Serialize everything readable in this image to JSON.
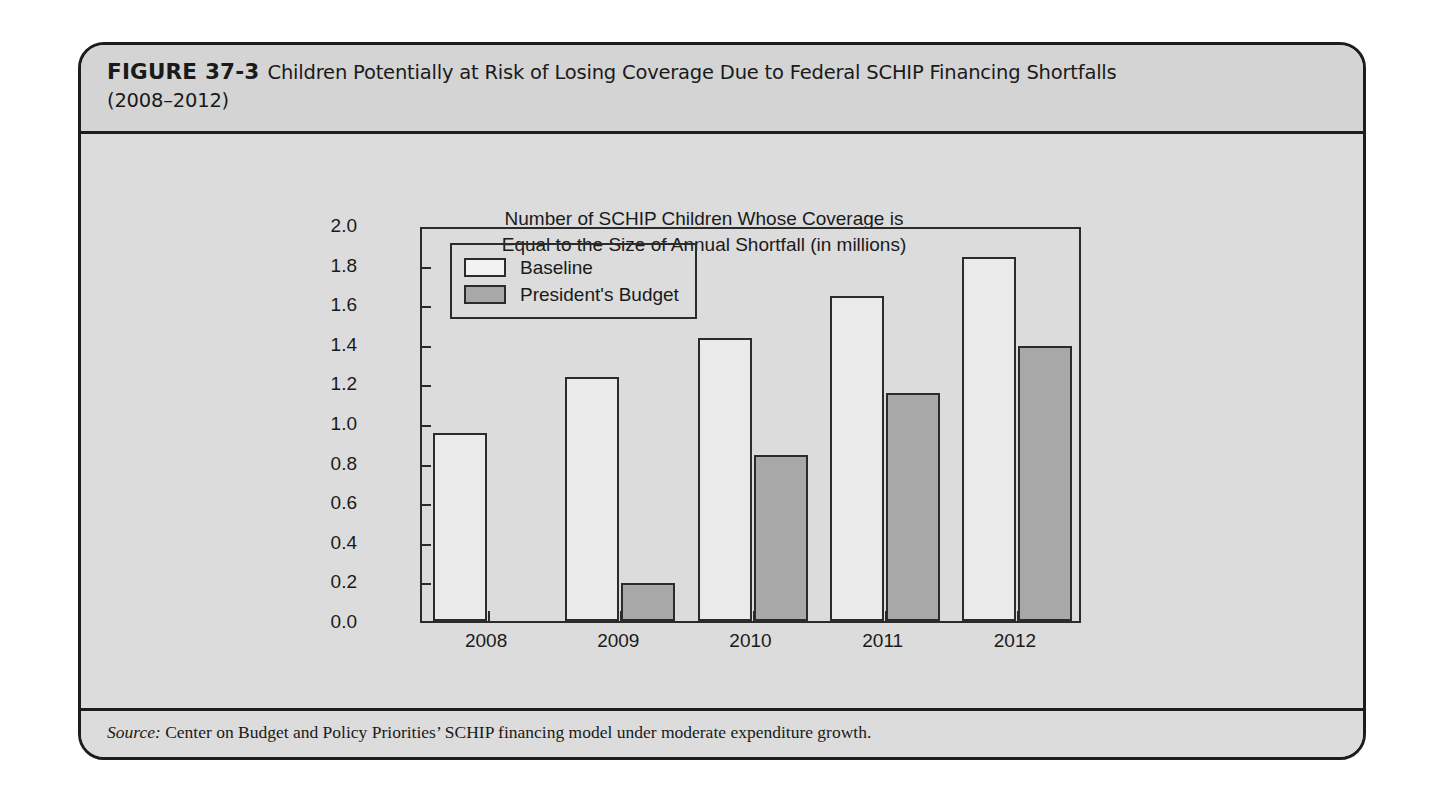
{
  "figure": {
    "number_label": "FIGURE 37-3",
    "title_line1": "Children Potentially at Risk of Losing Coverage Due to Federal SCHIP Financing Shortfalls",
    "title_line2": "(2008–2012)",
    "source_lead": "Source:",
    "source_text": " Center on Budget and Policy Priorities’ SCHIP financing model under moderate expenditure growth."
  },
  "colors": {
    "baseline_fill": "#eaeaea",
    "president_fill": "#a8a8a8",
    "frame": "#2b2b2b",
    "panel_bg": "#dcdcdc",
    "header_bg": "#d4d4d4"
  },
  "chart_data": {
    "type": "bar",
    "title": "Number of SCHIP Children Whose Coverage is\nEqual to the Size of Annual Shortfall (in millions)",
    "title_line1": "Number of SCHIP Children Whose Coverage is",
    "title_line2": "Equal to the Size of Annual Shortfall (in millions)",
    "xlabel": "",
    "ylabel": "",
    "ylim": [
      0.0,
      2.0
    ],
    "ytick_step": 0.2,
    "yticks": [
      "2.0",
      "1.8",
      "1.6",
      "1.4",
      "1.2",
      "1.0",
      "0.8",
      "0.6",
      "0.4",
      "0.2",
      "0.0"
    ],
    "ytick_values": [
      2.0,
      1.8,
      1.6,
      1.4,
      1.2,
      1.0,
      0.8,
      0.6,
      0.4,
      0.2,
      0.0
    ],
    "categories": [
      "2008",
      "2009",
      "2010",
      "2011",
      "2012"
    ],
    "grid": false,
    "legend_position": "upper left",
    "series": [
      {
        "name": "Baseline",
        "values": [
          0.95,
          1.23,
          1.43,
          1.64,
          1.84
        ]
      },
      {
        "name": "President's Budget",
        "values": [
          null,
          0.19,
          0.84,
          1.15,
          1.39
        ]
      }
    ]
  }
}
